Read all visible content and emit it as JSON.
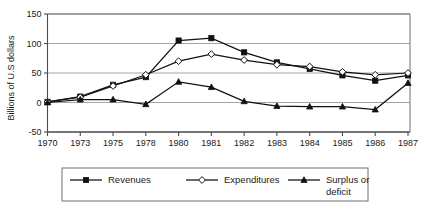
{
  "chart_data": {
    "type": "line",
    "title": "",
    "xlabel": "",
    "ylabel": "Billions of U.S dollars",
    "categories": [
      "1970",
      "1973",
      "1975",
      "1978",
      "1980",
      "1981",
      "1982",
      "1983",
      "1984",
      "1985",
      "1986",
      "1987"
    ],
    "ylim": [
      -50,
      150
    ],
    "yticks": [
      "-50",
      "0",
      "50",
      "100",
      "150"
    ],
    "ytick_values": [
      -50,
      0,
      50,
      100,
      150
    ],
    "grid": "horizontal",
    "legend_position": "bottom",
    "series": [
      {
        "name": "Revenues",
        "marker": "filled-square",
        "values": [
          1,
          10,
          30,
          43,
          105,
          109,
          85,
          68,
          57,
          46,
          37,
          46
        ]
      },
      {
        "name": "Expenditures",
        "marker": "open-diamond",
        "values": [
          1,
          9,
          28,
          47,
          70,
          82,
          72,
          64,
          61,
          52,
          47,
          50
        ]
      },
      {
        "name": "Surplus or deficit",
        "marker": "filled-triangle",
        "values": [
          0,
          5,
          5,
          -3,
          35,
          26,
          2,
          -6,
          -7,
          -7,
          -12,
          33
        ]
      }
    ]
  },
  "legend": {
    "items": [
      {
        "label": "Revenues",
        "marker": "filled-square"
      },
      {
        "label": "Expenditures",
        "marker": "open-diamond"
      },
      {
        "label_line1": "Surplus or",
        "label_line2": "deficit",
        "marker": "filled-triangle"
      }
    ]
  },
  "colors": {
    "ink": "#111111",
    "grid": "#9a9a9a",
    "axis": "#4d4d4d",
    "frame": "#6e6e6e",
    "background": "#ffffff"
  }
}
